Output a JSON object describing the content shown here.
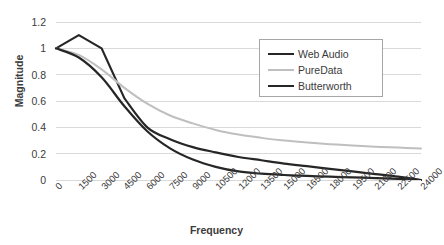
{
  "chart_data": {
    "type": "line",
    "title": "",
    "xlabel": "Frequency",
    "ylabel": "Magnitude",
    "grid": true,
    "legend_position": "top-right",
    "xlim": [
      0,
      24000
    ],
    "ylim": [
      0,
      1.2
    ],
    "yticks": [
      "0",
      "0.2",
      "0.4",
      "0.6",
      "0.8",
      "1",
      "1.2"
    ],
    "ytick_values": [
      0,
      0.2,
      0.4,
      0.6,
      0.8,
      1,
      1.2
    ],
    "categories": [
      "0",
      "1500",
      "3000",
      "4500",
      "6000",
      "7500",
      "9000",
      "10500",
      "12000",
      "13500",
      "15000",
      "16500",
      "18000",
      "19500",
      "21000",
      "22500",
      "24000"
    ],
    "x": [
      0,
      1500,
      3000,
      4500,
      6000,
      7500,
      9000,
      10500,
      12000,
      13500,
      15000,
      16500,
      18000,
      19500,
      21000,
      22500,
      24000
    ],
    "series": [
      {
        "name": "Web Audio",
        "color": "#262626",
        "width": 2.2,
        "values": [
          1.0,
          1.1,
          1.0,
          0.62,
          0.4,
          0.31,
          0.25,
          0.21,
          0.175,
          0.15,
          0.125,
          0.105,
          0.085,
          0.065,
          0.045,
          0.025,
          0.0
        ]
      },
      {
        "name": "PureData",
        "color": "#bfbfbf",
        "width": 2.0,
        "values": [
          1.0,
          0.95,
          0.84,
          0.7,
          0.58,
          0.49,
          0.43,
          0.38,
          0.345,
          0.32,
          0.3,
          0.285,
          0.272,
          0.262,
          0.253,
          0.246,
          0.24
        ]
      },
      {
        "name": "Butterworth",
        "color": "#262626",
        "width": 2.2,
        "values": [
          1.0,
          0.93,
          0.78,
          0.56,
          0.37,
          0.24,
          0.155,
          0.1,
          0.065,
          0.048,
          0.038,
          0.031,
          0.025,
          0.02,
          0.015,
          0.009,
          0.0
        ]
      }
    ]
  },
  "legend": {
    "items": [
      {
        "label": "Web Audio"
      },
      {
        "label": "PureData"
      },
      {
        "label": "Butterworth"
      }
    ]
  }
}
